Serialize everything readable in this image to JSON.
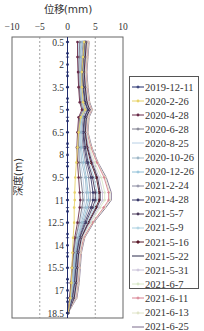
{
  "chart_data": {
    "type": "line",
    "title": "",
    "xlabel": "位移(mm)",
    "ylabel": "深度(m)",
    "xlim": [
      -10,
      10
    ],
    "ylim": [
      18.5,
      0.5
    ],
    "x_ticks": [
      "−10",
      "−5",
      "0",
      "5",
      "10"
    ],
    "y_ticks": [
      "0.5",
      "2",
      "3.5",
      "5",
      "6.5",
      "8",
      "9.5",
      "11",
      "12.5",
      "14",
      "15.5",
      "17",
      "18.5"
    ],
    "reference_lines": [
      -5,
      5
    ],
    "legend_position": "right",
    "depths": [
      0.5,
      1.5,
      2.5,
      3.5,
      4.5,
      5.0,
      5.5,
      6.5,
      7.5,
      8.5,
      9.5,
      10.5,
      11.0,
      11.5,
      12.5,
      13.5,
      14.5,
      15.5,
      16.5,
      17.5,
      18.5
    ],
    "series": [
      {
        "name": "2019-12-11",
        "color": "#1f2a6b",
        "marker": "plus",
        "values": [
          0,
          0,
          0,
          0,
          0,
          0,
          0,
          0,
          0,
          0,
          0,
          0,
          0,
          0,
          0,
          0,
          0,
          0,
          0,
          0,
          0
        ]
      },
      {
        "name": "2020-2-26",
        "color": "#e8d36a",
        "marker": "dot",
        "values": [
          3.0,
          2.8,
          2.6,
          2.6,
          2.8,
          3.2,
          2.4,
          2.0,
          1.8,
          1.6,
          1.4,
          1.3,
          1.3,
          1.2,
          1.2,
          1.0,
          0.9,
          0.8,
          0.7,
          0.5,
          0.1
        ]
      },
      {
        "name": "2020-4-28",
        "color": "#6a2c4a",
        "marker": "dot",
        "values": [
          1.8,
          1.8,
          1.9,
          2.0,
          2.2,
          2.6,
          2.0,
          1.8,
          1.7,
          1.8,
          2.0,
          2.2,
          2.3,
          2.2,
          1.8,
          1.3,
          1.0,
          0.8,
          0.6,
          0.4,
          0.1
        ]
      },
      {
        "name": "2020-6-28",
        "color": "#7a7a8a",
        "marker": "plus",
        "values": [
          2.2,
          2.1,
          2.0,
          2.1,
          2.4,
          2.8,
          2.2,
          2.0,
          2.0,
          2.1,
          2.4,
          2.7,
          2.8,
          2.6,
          2.1,
          1.5,
          1.1,
          0.9,
          0.7,
          0.4,
          0.1
        ]
      },
      {
        "name": "2020-8-25",
        "color": "#b8d0e6",
        "marker": "none",
        "values": [
          2.0,
          2.0,
          2.0,
          2.1,
          2.3,
          2.7,
          2.2,
          2.0,
          2.1,
          2.3,
          2.8,
          3.0,
          3.1,
          2.9,
          2.3,
          1.6,
          1.2,
          1.0,
          0.8,
          0.4,
          0.1
        ]
      },
      {
        "name": "2020-10-26",
        "color": "#9fb8c8",
        "marker": "dot",
        "values": [
          2.4,
          2.3,
          2.2,
          2.3,
          2.6,
          3.0,
          2.4,
          2.2,
          2.3,
          2.6,
          3.2,
          3.4,
          3.5,
          3.2,
          2.5,
          1.8,
          1.3,
          1.1,
          0.9,
          0.5,
          0.1
        ]
      },
      {
        "name": "2020-12-26",
        "color": "#8fc0d8",
        "marker": "plus",
        "values": [
          2.6,
          2.4,
          2.3,
          2.4,
          2.7,
          3.1,
          2.6,
          2.4,
          2.5,
          2.9,
          3.4,
          3.7,
          3.8,
          3.5,
          2.7,
          1.9,
          1.4,
          1.2,
          1.0,
          0.6,
          0.1
        ]
      },
      {
        "name": "2021-2-24",
        "color": "#8a8aa0",
        "marker": "plus",
        "values": [
          2.8,
          2.6,
          2.5,
          2.6,
          2.9,
          3.3,
          2.8,
          2.6,
          2.8,
          3.2,
          3.8,
          4.1,
          4.1,
          3.8,
          2.9,
          2.0,
          1.5,
          1.3,
          1.1,
          0.7,
          0.1
        ]
      },
      {
        "name": "2021-4-28",
        "color": "#3a3a6a",
        "marker": "dot",
        "values": [
          3.0,
          2.8,
          2.6,
          2.8,
          3.1,
          3.6,
          3.0,
          2.8,
          3.0,
          3.5,
          4.2,
          4.6,
          4.6,
          4.2,
          3.1,
          2.1,
          1.6,
          1.4,
          1.2,
          0.8,
          0.1
        ]
      },
      {
        "name": "2021-5-7",
        "color": "#4a3a5a",
        "marker": "dot",
        "values": [
          3.1,
          2.9,
          2.7,
          2.9,
          3.2,
          3.7,
          3.1,
          2.9,
          3.2,
          3.7,
          4.5,
          5.0,
          5.0,
          4.5,
          3.3,
          2.2,
          1.7,
          1.5,
          1.3,
          0.9,
          0.1
        ]
      },
      {
        "name": "2021-5-9",
        "color": "#a8cfe0",
        "marker": "plus",
        "values": [
          3.2,
          3.0,
          2.8,
          3.0,
          3.3,
          3.8,
          3.2,
          3.0,
          3.3,
          3.9,
          4.8,
          5.3,
          5.3,
          4.8,
          3.5,
          2.3,
          1.8,
          1.6,
          1.4,
          1.0,
          0.1
        ]
      },
      {
        "name": "2021-5-16",
        "color": "#5a1a2a",
        "marker": "diamond",
        "values": [
          3.3,
          3.1,
          2.9,
          3.1,
          3.4,
          3.9,
          3.3,
          3.1,
          3.5,
          4.2,
          5.2,
          5.7,
          5.7,
          5.1,
          3.7,
          2.4,
          1.9,
          1.7,
          1.5,
          1.1,
          0.1
        ]
      },
      {
        "name": "2021-5-22",
        "color": "#2a2a4a",
        "marker": "none",
        "values": [
          3.4,
          3.2,
          3.0,
          3.2,
          3.5,
          4.0,
          3.4,
          3.2,
          3.6,
          4.4,
          5.4,
          5.9,
          5.9,
          5.3,
          3.8,
          2.5,
          2.0,
          1.8,
          1.6,
          1.2,
          0.1
        ]
      },
      {
        "name": "2021-5-31",
        "color": "#c8c0d8",
        "marker": "plus",
        "values": [
          3.5,
          3.3,
          3.1,
          3.3,
          3.6,
          4.1,
          3.5,
          3.3,
          3.8,
          4.6,
          5.7,
          6.3,
          6.3,
          5.6,
          4.0,
          2.6,
          2.1,
          1.9,
          1.7,
          1.3,
          0.1
        ]
      },
      {
        "name": "2021-6-7",
        "color": "#d8e8c8",
        "marker": "dot",
        "values": [
          3.6,
          3.4,
          3.2,
          3.4,
          3.7,
          4.2,
          3.6,
          3.4,
          4.0,
          4.9,
          6.1,
          6.7,
          6.7,
          5.9,
          4.2,
          2.7,
          2.2,
          2.0,
          1.8,
          1.4,
          0.1
        ]
      },
      {
        "name": "2021-6-11",
        "color": "#d88090",
        "marker": "plus",
        "values": [
          3.7,
          3.5,
          3.3,
          3.5,
          3.8,
          4.3,
          3.7,
          3.5,
          4.2,
          5.3,
          6.6,
          7.4,
          7.4,
          6.5,
          4.5,
          2.9,
          2.3,
          2.1,
          1.9,
          1.5,
          0.1
        ]
      },
      {
        "name": "2021-6-13",
        "color": "#e0e4c8",
        "marker": "dot",
        "values": [
          3.8,
          3.6,
          3.4,
          3.6,
          3.9,
          4.4,
          3.8,
          3.6,
          4.3,
          5.4,
          6.8,
          7.6,
          7.6,
          6.7,
          4.6,
          3.0,
          2.4,
          2.2,
          2.0,
          1.6,
          0.1
        ]
      },
      {
        "name": "2021-6-25",
        "color": "#7a6a8a",
        "marker": "none",
        "values": [
          3.9,
          3.7,
          3.5,
          3.7,
          4.0,
          4.5,
          3.9,
          3.7,
          4.4,
          5.5,
          7.0,
          7.9,
          7.9,
          6.9,
          4.7,
          3.1,
          2.5,
          2.3,
          2.1,
          1.7,
          0.1
        ]
      }
    ]
  },
  "legend": {
    "items": [
      {
        "label": "2019-12-11"
      },
      {
        "label": "2020-2-26"
      },
      {
        "label": "2020-4-28"
      },
      {
        "label": "2020-6-28"
      },
      {
        "label": "2020-8-25"
      },
      {
        "label": "2020-10-26"
      },
      {
        "label": "2020-12-26"
      },
      {
        "label": "2021-2-24"
      },
      {
        "label": "2021-4-28"
      },
      {
        "label": "2021-5-7"
      },
      {
        "label": "2021-5-9"
      },
      {
        "label": "2021-5-16"
      },
      {
        "label": "2021-5-22"
      },
      {
        "label": "2021-5-31"
      },
      {
        "label": "2021-6-7"
      },
      {
        "label": "2021-6-11"
      },
      {
        "label": "2021-6-13"
      },
      {
        "label": "2021-6-25"
      }
    ]
  }
}
